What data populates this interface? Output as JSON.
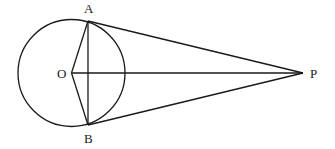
{
  "diagram": {
    "type": "geometry",
    "stroke_color": "#1a1a1a",
    "background": "#ffffff",
    "circle": {
      "center_label": "O",
      "cx": 71.5,
      "cy": 73,
      "r": 53.5
    },
    "points": {
      "O": {
        "label": "O",
        "x": 71.5,
        "y": 73,
        "label_x": 57,
        "label_y": 78
      },
      "A": {
        "label": "A",
        "x": 88,
        "y": 21,
        "label_x": 84,
        "label_y": 13
      },
      "B": {
        "label": "B",
        "x": 88,
        "y": 125,
        "label_x": 84,
        "label_y": 143
      },
      "P": {
        "label": "P",
        "x": 303,
        "y": 73,
        "label_x": 310,
        "label_y": 78
      }
    },
    "segments": [
      {
        "name": "tangent-PA",
        "from": "P",
        "to": "A"
      },
      {
        "name": "tangent-PB",
        "from": "P",
        "to": "B"
      },
      {
        "name": "segment-OP",
        "from": "O",
        "to": "P"
      },
      {
        "name": "chord-AB",
        "from": "A",
        "to": "B"
      },
      {
        "name": "radius-OA",
        "from": "O",
        "to": "A"
      },
      {
        "name": "radius-OB",
        "from": "O",
        "to": "B"
      }
    ]
  }
}
